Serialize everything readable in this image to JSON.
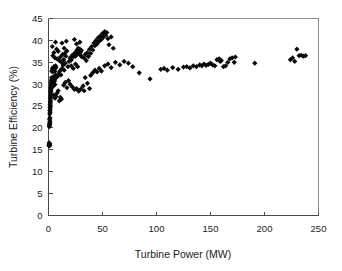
{
  "chart_data": {
    "type": "scatter",
    "title": "",
    "xlabel": "Turbine Power (MW)",
    "ylabel": "Turbine Efficiency (%)",
    "xlim": [
      0,
      250
    ],
    "ylim": [
      0,
      45
    ],
    "xticks": [
      0,
      50,
      100,
      150,
      200,
      250
    ],
    "yticks": [
      0,
      5,
      10,
      15,
      20,
      25,
      30,
      35,
      40,
      45
    ],
    "xtick_labels": [
      "0",
      "50",
      "100",
      "150",
      "200",
      "250"
    ],
    "ytick_labels": [
      "0",
      "5",
      "10",
      "15",
      "20",
      "25",
      "30",
      "35",
      "40",
      "45"
    ],
    "grid": false,
    "legend": null,
    "legend_position": "none",
    "marker": {
      "shape": "diamond",
      "color": "#0a0a0a",
      "size": 2.6
    },
    "series": [
      {
        "name": "Turbine efficiency vs power",
        "points": [
          [
            0.5,
            16.0
          ],
          [
            0.6,
            16.2
          ],
          [
            0.7,
            15.9
          ],
          [
            0.8,
            16.3
          ],
          [
            0.9,
            16.1
          ],
          [
            1.0,
            16.4
          ],
          [
            0.6,
            16.6
          ],
          [
            1.1,
            16.0
          ],
          [
            0.8,
            20.3
          ],
          [
            0.9,
            20.6
          ],
          [
            1.0,
            21.0
          ],
          [
            1.1,
            20.8
          ],
          [
            1.2,
            21.3
          ],
          [
            1.3,
            21.6
          ],
          [
            1.0,
            22.0
          ],
          [
            1.4,
            22.3
          ],
          [
            1.2,
            23.2
          ],
          [
            1.5,
            23.6
          ],
          [
            1.3,
            24.0
          ],
          [
            1.6,
            24.3
          ],
          [
            1.4,
            24.7
          ],
          [
            1.7,
            25.0
          ],
          [
            1.5,
            25.4
          ],
          [
            1.8,
            25.7
          ],
          [
            1.6,
            26.0
          ],
          [
            1.9,
            26.3
          ],
          [
            1.7,
            26.7
          ],
          [
            2.0,
            27.0
          ],
          [
            1.8,
            27.3
          ],
          [
            2.1,
            27.6
          ],
          [
            1.9,
            28.0
          ],
          [
            2.2,
            28.3
          ],
          [
            2.0,
            28.6
          ],
          [
            2.4,
            28.9
          ],
          [
            2.2,
            29.2
          ],
          [
            2.6,
            29.5
          ],
          [
            2.4,
            29.8
          ],
          [
            2.8,
            30.1
          ],
          [
            2.5,
            30.4
          ],
          [
            3.0,
            30.6
          ],
          [
            2.7,
            30.9
          ],
          [
            3.2,
            31.2
          ],
          [
            2.9,
            31.5
          ],
          [
            3.4,
            31.0
          ],
          [
            3.1,
            30.3
          ],
          [
            3.6,
            29.8
          ],
          [
            3.3,
            29.3
          ],
          [
            3.8,
            30.0
          ],
          [
            3.5,
            30.8
          ],
          [
            4.0,
            31.4
          ],
          [
            4.2,
            30.2
          ],
          [
            4.5,
            29.6
          ],
          [
            4.8,
            30.5
          ],
          [
            5.0,
            31.1
          ],
          [
            5.3,
            31.8
          ],
          [
            5.6,
            30.7
          ],
          [
            6.0,
            29.9
          ],
          [
            6.3,
            31.3
          ],
          [
            6.6,
            32.0
          ],
          [
            7.0,
            31.5
          ],
          [
            3.0,
            33.0
          ],
          [
            3.5,
            33.6
          ],
          [
            4.0,
            32.8
          ],
          [
            4.5,
            33.3
          ],
          [
            5.0,
            34.0
          ],
          [
            5.5,
            33.5
          ],
          [
            6.0,
            32.9
          ],
          [
            6.5,
            34.2
          ],
          [
            7.0,
            33.8
          ],
          [
            4.0,
            36.5
          ],
          [
            5.0,
            37.2
          ],
          [
            6.0,
            36.0
          ],
          [
            7.5,
            38.0
          ],
          [
            8.0,
            35.8
          ],
          [
            3.5,
            38.6
          ],
          [
            6.5,
            39.6
          ],
          [
            9.0,
            37.5
          ],
          [
            5.0,
            27.5
          ],
          [
            6.0,
            26.8
          ],
          [
            7.0,
            27.2
          ],
          [
            8.0,
            28.0
          ],
          [
            9.0,
            28.5
          ],
          [
            10.0,
            26.2
          ],
          [
            11.0,
            27.0
          ],
          [
            12.0,
            26.6
          ],
          [
            8.5,
            31.8
          ],
          [
            9.5,
            32.4
          ],
          [
            10.5,
            33.0
          ],
          [
            11.5,
            32.1
          ],
          [
            12.5,
            33.6
          ],
          [
            13.5,
            34.3
          ],
          [
            14.5,
            33.2
          ],
          [
            15.5,
            34.8
          ],
          [
            10.0,
            35.4
          ],
          [
            11.0,
            36.2
          ],
          [
            12.0,
            35.0
          ],
          [
            13.0,
            36.8
          ],
          [
            14.0,
            35.6
          ],
          [
            15.0,
            37.0
          ],
          [
            16.0,
            36.4
          ],
          [
            17.0,
            37.6
          ],
          [
            12.5,
            39.4
          ],
          [
            14.5,
            38.2
          ],
          [
            16.5,
            39.8
          ],
          [
            14.0,
            29.8
          ],
          [
            15.5,
            30.4
          ],
          [
            17.0,
            29.2
          ],
          [
            18.5,
            30.8
          ],
          [
            18.0,
            34.0
          ],
          [
            19.0,
            35.2
          ],
          [
            20.0,
            36.0
          ],
          [
            21.0,
            35.5
          ],
          [
            22.0,
            36.6
          ],
          [
            23.0,
            36.2
          ],
          [
            24.0,
            37.0
          ],
          [
            25.0,
            36.4
          ],
          [
            25.5,
            37.4
          ],
          [
            26.0,
            36.8
          ],
          [
            26.5,
            37.8
          ],
          [
            27.0,
            37.2
          ],
          [
            27.5,
            38.2
          ],
          [
            28.0,
            37.6
          ],
          [
            28.5,
            36.9
          ],
          [
            29.0,
            38.0
          ],
          [
            29.5,
            37.3
          ],
          [
            30.0,
            36.5
          ],
          [
            30.5,
            37.7
          ],
          [
            31.0,
            36.2
          ],
          [
            24.0,
            40.2
          ],
          [
            26.0,
            39.2
          ],
          [
            29.0,
            39.6
          ],
          [
            21.0,
            34.2
          ],
          [
            23.0,
            33.6
          ],
          [
            25.0,
            34.6
          ],
          [
            27.0,
            34.0
          ],
          [
            20.0,
            30.0
          ],
          [
            22.0,
            29.4
          ],
          [
            24.0,
            28.8
          ],
          [
            26.0,
            29.0
          ],
          [
            28.0,
            28.4
          ],
          [
            30.0,
            28.9
          ],
          [
            32.0,
            29.6
          ],
          [
            33.0,
            28.5
          ],
          [
            33.0,
            36.0
          ],
          [
            34.0,
            36.8
          ],
          [
            35.0,
            35.4
          ],
          [
            36.0,
            37.2
          ],
          [
            37.0,
            36.3
          ],
          [
            38.0,
            38.0
          ],
          [
            39.0,
            37.0
          ],
          [
            40.0,
            38.6
          ],
          [
            41.0,
            37.8
          ],
          [
            42.0,
            39.4
          ],
          [
            43.0,
            38.8
          ],
          [
            44.0,
            40.0
          ],
          [
            45.0,
            39.2
          ],
          [
            46.0,
            40.6
          ],
          [
            47.0,
            39.8
          ],
          [
            48.0,
            41.0
          ],
          [
            49.0,
            40.2
          ],
          [
            50.0,
            41.6
          ],
          [
            51.0,
            40.8
          ],
          [
            52.0,
            42.0
          ],
          [
            53.0,
            41.2
          ],
          [
            54.0,
            41.8
          ],
          [
            55.0,
            40.4
          ],
          [
            56.0,
            39.0
          ],
          [
            58.0,
            40.8
          ],
          [
            60.0,
            38.2
          ],
          [
            34.0,
            31.5
          ],
          [
            36.0,
            30.2
          ],
          [
            38.0,
            29.0
          ],
          [
            39.0,
            32.0
          ],
          [
            41.0,
            32.6
          ],
          [
            43.0,
            33.2
          ],
          [
            45.0,
            32.8
          ],
          [
            47.0,
            33.6
          ],
          [
            49.0,
            33.0
          ],
          [
            52.0,
            34.2
          ],
          [
            55.0,
            34.6
          ],
          [
            58.0,
            33.8
          ],
          [
            62.0,
            35.0
          ],
          [
            66.0,
            34.4
          ],
          [
            70.0,
            35.2
          ],
          [
            74.0,
            34.8
          ],
          [
            78.0,
            34.0
          ],
          [
            84.0,
            32.6
          ],
          [
            94.0,
            31.2
          ],
          [
            104.0,
            33.4
          ],
          [
            107.0,
            33.6
          ],
          [
            110.0,
            33.2
          ],
          [
            115.0,
            33.8
          ],
          [
            120.0,
            33.4
          ],
          [
            125.0,
            33.9
          ],
          [
            128.0,
            34.0
          ],
          [
            131.0,
            33.7
          ],
          [
            134.0,
            34.2
          ],
          [
            137.0,
            34.0
          ],
          [
            140.0,
            34.4
          ],
          [
            142.0,
            34.2
          ],
          [
            144.0,
            34.6
          ],
          [
            146.0,
            34.3
          ],
          [
            148.0,
            34.5
          ],
          [
            150.0,
            34.8
          ],
          [
            152.0,
            34.4
          ],
          [
            154.0,
            34.2
          ],
          [
            156.0,
            35.6
          ],
          [
            158.0,
            35.8
          ],
          [
            159.0,
            35.2
          ],
          [
            160.0,
            35.4
          ],
          [
            162.0,
            34.0
          ],
          [
            164.0,
            34.2
          ],
          [
            166.0,
            35.0
          ],
          [
            168.0,
            35.8
          ],
          [
            170.0,
            36.0
          ],
          [
            172.0,
            35.0
          ],
          [
            173.0,
            36.2
          ],
          [
            191.0,
            34.8
          ],
          [
            224.0,
            35.6
          ],
          [
            226.0,
            36.0
          ],
          [
            228.0,
            35.2
          ],
          [
            230.0,
            38.0
          ],
          [
            232.0,
            36.5
          ],
          [
            234.0,
            36.6
          ],
          [
            236.0,
            36.4
          ],
          [
            238.0,
            36.5
          ]
        ]
      }
    ]
  },
  "figure": {
    "background_color": "#ffffff",
    "frame_color": "#8d8d8d",
    "axis_color": "#4a4a4a",
    "marker_color": "#0a0a0a"
  }
}
